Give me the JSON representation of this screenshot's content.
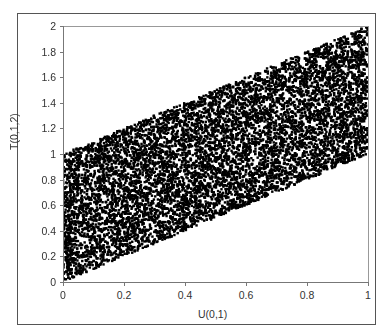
{
  "chart_data": {
    "type": "scatter",
    "title": "",
    "xlabel": "U(0,1)",
    "ylabel": "T(0,1,2)",
    "xlim": [
      0,
      1
    ],
    "ylim": [
      0,
      2
    ],
    "x_ticks": [
      "0",
      "0.2",
      "0.4",
      "0.6",
      "0.8",
      "1"
    ],
    "y_ticks": [
      "0",
      "0.2",
      "0.4",
      "0.6",
      "0.8",
      "1",
      "1.2",
      "1.4",
      "1.6",
      "1.8",
      "2"
    ],
    "grid": false,
    "legend": null,
    "marker_color": "#000000",
    "region_vertices": [
      [
        0,
        0
      ],
      [
        0,
        1
      ],
      [
        1,
        2
      ],
      [
        1,
        1
      ]
    ],
    "approx_point_count": 10000
  },
  "labels": {
    "xlabel": "U(0,1)",
    "ylabel": "T(0,1,2)"
  }
}
